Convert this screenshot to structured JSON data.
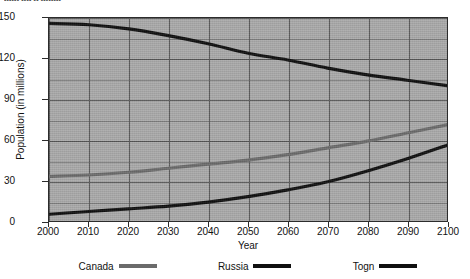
{
  "top_caption": "------ ---- -- --------",
  "chart_data": {
    "type": "line",
    "title": "",
    "xlabel": "Year",
    "ylabel": "Population (in millions)",
    "x": [
      2000,
      2010,
      2020,
      2030,
      2040,
      2050,
      2060,
      2070,
      2080,
      2090,
      2100
    ],
    "xlim": [
      2000,
      2100
    ],
    "ylim": [
      0,
      150
    ],
    "yticks": [
      0,
      30,
      60,
      90,
      120,
      150
    ],
    "xticks": [
      2000,
      2010,
      2020,
      2030,
      2040,
      2050,
      2060,
      2070,
      2080,
      2090,
      2100
    ],
    "grid": true,
    "grid_minor_step": 15,
    "legend_position": "below",
    "series": [
      {
        "name": "Canada",
        "color": "#6b6b6b",
        "values": [
          33,
          34,
          36,
          39,
          42,
          45,
          49,
          54,
          59,
          65,
          71
        ]
      },
      {
        "name": "Russia",
        "color": "#101010",
        "values": [
          146,
          145,
          142,
          137,
          131,
          124,
          119,
          113,
          108,
          104,
          100
        ]
      },
      {
        "name": "Togn",
        "color": "#101010",
        "values": [
          5,
          7,
          9,
          11,
          14,
          18,
          23,
          29,
          37,
          46,
          56
        ]
      }
    ]
  },
  "legend": {
    "items": [
      {
        "label": "Canada",
        "color": "#6b6b6b"
      },
      {
        "label": "Russia",
        "color": "#101010"
      },
      {
        "label": "Togn",
        "color": "#101010"
      }
    ]
  },
  "colors": {
    "plot_background": "#a9a9a9",
    "grid": "#555555",
    "frame": "#2c2c2c",
    "text": "#121212",
    "page_background": "#ffffff"
  }
}
